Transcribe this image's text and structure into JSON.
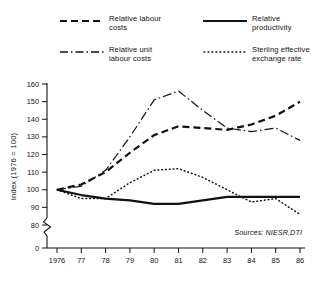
{
  "legend": {
    "items": [
      {
        "key": "dashed",
        "name": "relative-labour-costs",
        "label": "Relative labour\ncosts"
      },
      {
        "key": "solid",
        "name": "relative-productivity",
        "label": "Relative\nproductivity"
      },
      {
        "key": "dash-dot",
        "name": "relative-unit-labour-costs",
        "label": "Relative unit\nlabour costs"
      },
      {
        "key": "dotted",
        "name": "sterling-effective-exchange-rate",
        "label": "Sterling effective\nexchange rate"
      }
    ]
  },
  "axes": {
    "ylabel": "Index (1976 = 100)",
    "yticks": [
      "160",
      "150",
      "140",
      "130",
      "120",
      "110",
      "100",
      "90",
      "80",
      "0"
    ],
    "xticks": [
      "1976",
      "77",
      "78",
      "79",
      "80",
      "81",
      "82",
      "83",
      "84",
      "85",
      "86"
    ]
  },
  "source": "Sources: NIESR,DTI",
  "colors": {
    "ink": "#111111",
    "background": "#ffffff"
  },
  "chart_data": {
    "type": "line",
    "title": "",
    "xlabel": "",
    "ylabel": "Index (1976 = 100)",
    "x": [
      1976,
      1977,
      1978,
      1979,
      1980,
      1981,
      1982,
      1983,
      1984,
      1985,
      1986
    ],
    "xtick_labels": [
      "1976",
      "77",
      "78",
      "79",
      "80",
      "81",
      "82",
      "83",
      "84",
      "85",
      "86"
    ],
    "ylim": [
      78,
      165
    ],
    "ytick_values": [
      160,
      150,
      140,
      130,
      120,
      110,
      100,
      90,
      80,
      0
    ],
    "axis_break": true,
    "grid": false,
    "legend_position": "top",
    "series": [
      {
        "name": "Relative labour costs",
        "style": "dashed",
        "values": [
          100,
          103,
          110,
          121,
          131,
          136,
          135,
          134,
          137,
          142,
          150
        ]
      },
      {
        "name": "Relative productivity",
        "style": "solid",
        "values": [
          100,
          97,
          95,
          94,
          92,
          92,
          94,
          96,
          96,
          96,
          96
        ]
      },
      {
        "name": "Relative unit labour costs",
        "style": "dash-dot",
        "values": [
          100,
          102,
          111,
          130,
          151,
          156,
          145,
          135,
          133,
          135,
          128
        ]
      },
      {
        "name": "Sterling effective exchange rate",
        "style": "dotted",
        "values": [
          100,
          95,
          95,
          104,
          111,
          112,
          107,
          100,
          93,
          95,
          86
        ]
      }
    ]
  }
}
